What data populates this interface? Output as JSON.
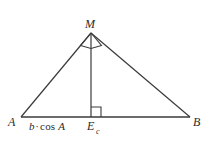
{
  "figure": {
    "type": "geometry-diagram",
    "background_color": "#ffffff",
    "stroke_color": "#3a3a3a",
    "label_color": "#2b2b2b"
  },
  "points": {
    "A": {
      "label": "A",
      "x": 21,
      "y": 117
    },
    "B": {
      "label": "B",
      "x": 190,
      "y": 117
    },
    "M": {
      "label": "M",
      "x": 91,
      "y": 33
    },
    "E": {
      "label": "E",
      "subscript": "c",
      "x": 91,
      "y": 117
    }
  },
  "segments": [
    {
      "name": "base-AB",
      "from": "A",
      "to": "B"
    },
    {
      "name": "side-AM",
      "from": "A",
      "to": "M"
    },
    {
      "name": "side-MB",
      "from": "M",
      "to": "B"
    },
    {
      "name": "altitude-ME",
      "from": "M",
      "to": "E"
    }
  ],
  "angle_markers": [
    {
      "name": "right-angle-at-M",
      "vertex": "M",
      "style": "kite"
    },
    {
      "name": "right-angle-at-E",
      "vertex": "E",
      "style": "square"
    }
  ],
  "labels": {
    "segment_AE": {
      "full": "b·cos A",
      "variable": "b",
      "operator": "·",
      "function": "cos",
      "argument": "A"
    }
  }
}
